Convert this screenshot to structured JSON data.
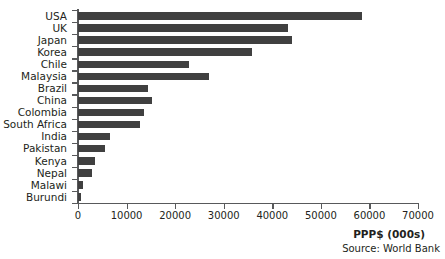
{
  "chart_data": {
    "type": "bar",
    "orientation": "horizontal",
    "title": "",
    "xlabel": "PPP$ (000s)",
    "ylabel": "",
    "xlim": [
      0,
      70000
    ],
    "xticks": [
      0,
      10000,
      20000,
      30000,
      40000,
      50000,
      60000,
      70000
    ],
    "xtick_labels": [
      "0",
      "10000",
      "20000",
      "30000",
      "40000",
      "50000",
      "60000",
      "70000"
    ],
    "grid": false,
    "legend": false,
    "bar_color": "#404040",
    "axis_color": "#58595b",
    "categories": [
      "USA",
      "UK",
      "Japan",
      "Korea",
      "Chile",
      "Malaysia",
      "Brazil",
      "China",
      "Colombia",
      "South Africa",
      "India",
      "Pakistan",
      "Kenya",
      "Nepal",
      "Malawi",
      "Burundi"
    ],
    "values": [
      58500,
      43300,
      44100,
      35800,
      22900,
      27000,
      14500,
      15300,
      13600,
      12800,
      6600,
      5600,
      3400,
      2800,
      1100,
      550
    ],
    "annotations": {
      "source": "Source: World Bank"
    }
  }
}
